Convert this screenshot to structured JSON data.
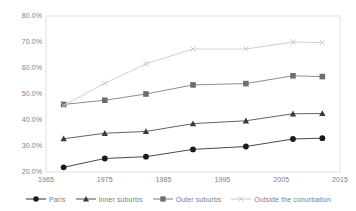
{
  "chart_data": {
    "type": "line",
    "title": "",
    "subtitle": "",
    "xlabel": "",
    "ylabel": "",
    "xlim": [
      1965,
      2015
    ],
    "ylim": [
      20,
      80
    ],
    "grid": false,
    "legend_position": "bottom",
    "x_ticks": [
      "1965",
      "1975",
      "1985",
      "1995",
      "2005",
      "2015"
    ],
    "x_tick_values": [
      1965,
      1975,
      1985,
      1995,
      2005,
      2015
    ],
    "y_ticks": [
      "20.0%",
      "30.0%",
      "40.0%",
      "50.0%",
      "60.0%",
      "70.0%",
      "80.0%"
    ],
    "y_tick_values": [
      20,
      30,
      40,
      50,
      60,
      70,
      80
    ],
    "x": [
      1968,
      1975,
      1982,
      1990,
      1999,
      2007,
      2012
    ],
    "series": [
      {
        "name": "Paris",
        "marker": "circle",
        "color": "#1a1a1a",
        "values": [
          21.8,
          25.2,
          25.9,
          28.7,
          29.8,
          32.7,
          33.0
        ]
      },
      {
        "name": "Inner suburbs",
        "marker": "triangle",
        "color": "#3b3b3b",
        "values": [
          32.8,
          34.9,
          35.6,
          38.6,
          39.7,
          42.4,
          42.5
        ]
      },
      {
        "name": "Outer suburbs",
        "marker": "square",
        "color": "#6e6e6e",
        "values": [
          46.0,
          47.6,
          50.0,
          53.5,
          54.0,
          57.0,
          56.7
        ]
      },
      {
        "name": "Outside the conurbation",
        "marker": "cross",
        "color": "#c4c4c4",
        "values": [
          45.6,
          54.1,
          61.6,
          67.3,
          67.3,
          70.0,
          69.8
        ]
      }
    ]
  },
  "legend": {
    "items": [
      {
        "label": "Paris"
      },
      {
        "label": "Inner suburbs"
      },
      {
        "label": "Outer suburbs"
      },
      {
        "label": "Outside the conurbation"
      }
    ]
  },
  "axes": {
    "plot_border_color": "#d9d9d9"
  }
}
